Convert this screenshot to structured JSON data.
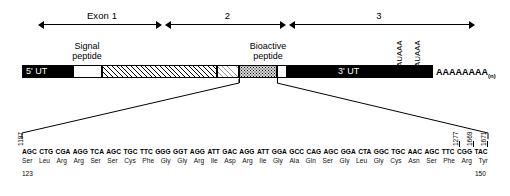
{
  "figure": {
    "type": "gene-structure-diagram",
    "caption": ""
  },
  "exons": {
    "items": [
      {
        "label": "Exon 1",
        "name": "exon-1"
      },
      {
        "label": "2",
        "name": "exon-2"
      },
      {
        "label": "3",
        "name": "exon-3"
      }
    ]
  },
  "transcript": {
    "five_utr_label": "5' UT",
    "three_utr_label": "3' UT",
    "signal_peptide_label_line1": "Signal",
    "signal_peptide_label_line2": "peptide",
    "bioactive_peptide_label_line1": "Bioactive",
    "bioactive_peptide_label_line2": "peptide",
    "polyadenylation_signal_1": "AAUAAA",
    "polyadenylation_signal_2": "AAUAAA",
    "poly_a_tail": "AAAAAAAA",
    "poly_a_subscript": "(n)"
  },
  "sequence_panel": {
    "nt_number_left": "1197",
    "nt_numbers_right": [
      "1277",
      "1669",
      "1671"
    ],
    "aa_number_left": "123",
    "aa_number_right": "150",
    "codons": [
      "AGC",
      "CTG",
      "CGA",
      "AGG",
      "TCA",
      "AGC",
      "TGC",
      "TTC",
      "GGG",
      "GGT",
      "AGG",
      "ATT",
      "GAC",
      "AGG",
      "ATT",
      "GGA",
      "GCC",
      "CAG",
      "AGC",
      "GGA",
      "CTA",
      "GGC",
      "TGC",
      "AAC",
      "AGC",
      "TTC",
      "CGG",
      "TAC"
    ],
    "amino_acids": [
      "Ser",
      "Leu",
      "Arg",
      "Arg",
      "Ser",
      "Ser",
      "Cys",
      "Phe",
      "Gly",
      "Gly",
      "Arg",
      "Ile",
      "Asp",
      "Arg",
      "Ile",
      "Gly",
      "Ala",
      "Gln",
      "Ser",
      "Gly",
      "Leu",
      "Gly",
      "Cys",
      "Asn",
      "Ser",
      "Phe",
      "Arg",
      "Tyr"
    ]
  },
  "colors": {
    "ink": "#000000",
    "paper": "#ffffff",
    "bioactive_fill": "#d6d6d6"
  }
}
